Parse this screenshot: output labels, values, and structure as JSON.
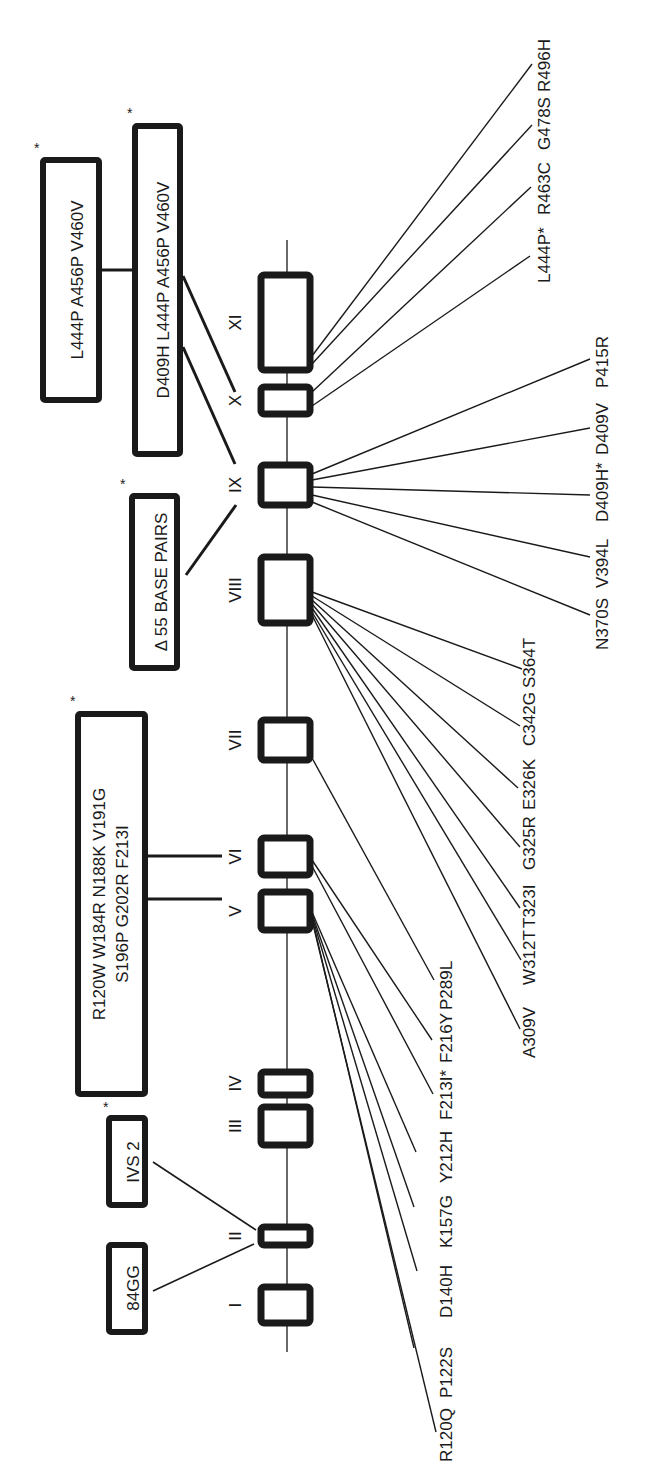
{
  "diagram": {
    "type": "gene-exon-mutation-map",
    "orientation": "rotated-90-ccw",
    "colors": {
      "ink": "#1a1a1a",
      "background": "#ffffff"
    },
    "exons": [
      {
        "label": "I",
        "y1": 1287,
        "y2": 1323
      },
      {
        "label": "II",
        "y1": 1227,
        "y2": 1245
      },
      {
        "label": "III",
        "y1": 1107,
        "y2": 1145
      },
      {
        "label": "IV",
        "y1": 1072,
        "y2": 1095
      },
      {
        "label": "V",
        "y1": 892,
        "y2": 930
      },
      {
        "label": "VI",
        "y1": 838,
        "y2": 875
      },
      {
        "label": "VII",
        "y1": 720,
        "y2": 760
      },
      {
        "label": "VIII",
        "y1": 557,
        "y2": 623
      },
      {
        "label": "IX",
        "y1": 465,
        "y2": 505
      },
      {
        "label": "X",
        "y1": 387,
        "y2": 414
      },
      {
        "label": "XI",
        "y1": 275,
        "y2": 370
      }
    ],
    "point_mutations": [
      {
        "label": "R120Q",
        "exon": "V"
      },
      {
        "label": "P122S",
        "exon": "V"
      },
      {
        "label": "D140H",
        "exon": "V"
      },
      {
        "label": "K157G",
        "exon": "V"
      },
      {
        "label": "Y212H",
        "exon": "V"
      },
      {
        "label": "F213I*",
        "exon": "VI"
      },
      {
        "label": "F216Y",
        "exon": "VI"
      },
      {
        "label": "P289L",
        "exon": "VII"
      },
      {
        "label": "A309V",
        "exon": "VIII"
      },
      {
        "label": "W312T",
        "exon": "VIII"
      },
      {
        "label": "T323I",
        "exon": "VIII"
      },
      {
        "label": "G325R",
        "exon": "VIII"
      },
      {
        "label": "E326K",
        "exon": "VIII"
      },
      {
        "label": "C342G",
        "exon": "VIII"
      },
      {
        "label": "S364T",
        "exon": "VIII"
      },
      {
        "label": "N370S",
        "exon": "IX"
      },
      {
        "label": "V394L",
        "exon": "IX"
      },
      {
        "label": "D409H*",
        "exon": "IX"
      },
      {
        "label": "D409V",
        "exon": "IX"
      },
      {
        "label": "P415R",
        "exon": "IX"
      },
      {
        "label": "L444P*",
        "exon": "X"
      },
      {
        "label": "R463C",
        "exon": "X"
      },
      {
        "label": "G478S",
        "exon": "XI"
      },
      {
        "label": "R496H",
        "exon": "XI"
      }
    ],
    "complex_alleles": [
      {
        "id": "84gg",
        "text_lines": [
          "84GG"
        ],
        "asterisk": false,
        "target_exons": [
          "II"
        ]
      },
      {
        "id": "ivs2",
        "text_lines": [
          "IVS 2"
        ],
        "asterisk": true,
        "target_exons": [
          "II"
        ]
      },
      {
        "id": "exon5-6-complex",
        "text_lines": [
          "R120W  W184R  N188K  V191G",
          "S196P  G202R  F213I"
        ],
        "asterisk": true,
        "target_exons": [
          "V",
          "VI"
        ]
      },
      {
        "id": "del55",
        "text_lines": [
          "Δ 55 BASE PAIRS"
        ],
        "asterisk": true,
        "target_exons": [
          "IX"
        ]
      },
      {
        "id": "recnci",
        "text_lines": [
          "D409H L444P  A456P  V460V"
        ],
        "asterisk": true,
        "target_exons": [
          "IX",
          "X"
        ]
      },
      {
        "id": "recnci-short",
        "text_lines": [
          "L444P  A456P  V460V"
        ],
        "asterisk": true,
        "target_exons": []
      }
    ],
    "asterisk": "*"
  }
}
